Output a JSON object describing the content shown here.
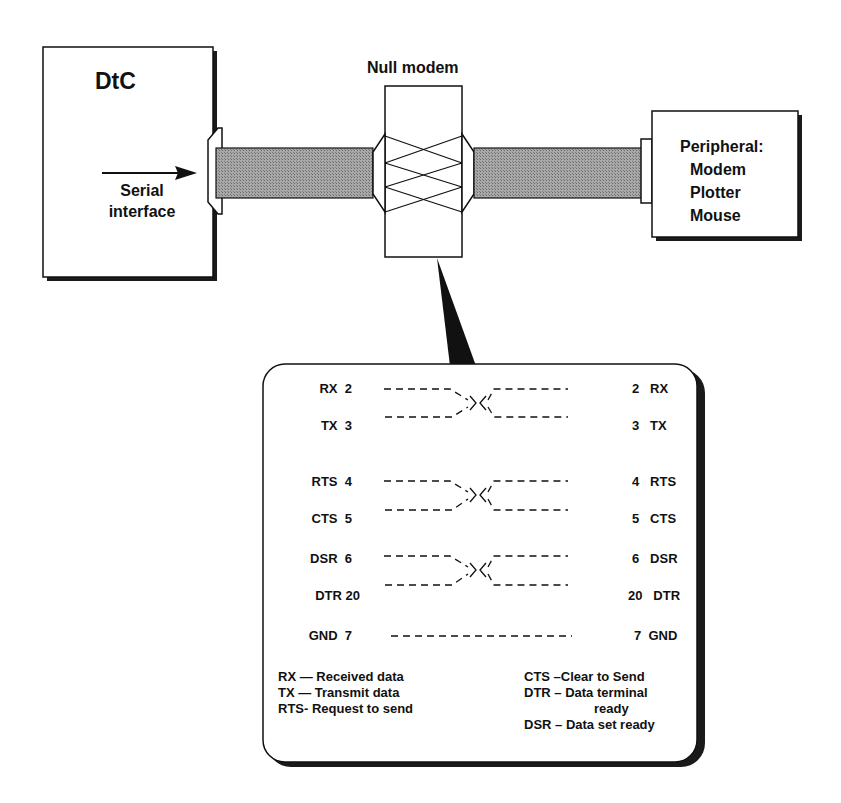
{
  "diagram": {
    "dtc": {
      "title": "DtC",
      "serial_label_line1": "Serial",
      "serial_label_line2": "interface"
    },
    "null_modem": {
      "label": "Null modem"
    },
    "peripheral": {
      "title": "Peripheral:",
      "items": [
        "Modem",
        "Plotter",
        "Mouse"
      ]
    },
    "pinout": {
      "rows": [
        {
          "left_name": "RX",
          "left_pin": "2",
          "right_pin": "2",
          "right_name": "RX"
        },
        {
          "left_name": "TX",
          "left_pin": "3",
          "right_pin": "3",
          "right_name": "TX"
        },
        {
          "left_name": "RTS",
          "left_pin": "4",
          "right_pin": "4",
          "right_name": "RTS"
        },
        {
          "left_name": "CTS",
          "left_pin": "5",
          "right_pin": "5",
          "right_name": "CTS"
        },
        {
          "left_name": "DSR",
          "left_pin": "6",
          "right_pin": "6",
          "right_name": "DSR"
        },
        {
          "left_name": "DTR",
          "left_pin": "20",
          "right_pin": "20",
          "right_name": "DTR"
        },
        {
          "left_name": "GND",
          "left_pin": "7",
          "right_pin": "7",
          "right_name": "GND"
        }
      ],
      "crossed_pairs": [
        [
          "RX",
          "TX"
        ],
        [
          "RTS",
          "CTS"
        ],
        [
          "DSR",
          "DTR"
        ]
      ],
      "straight": [
        "GND"
      ]
    },
    "legend_left": [
      "RX — Received data",
      "TX — Transmit data",
      "RTS- Request to send"
    ],
    "legend_right": [
      "CTS –Clear to Send",
      "DTR – Data terminal",
      "ready",
      "DSR – Data set ready"
    ],
    "colors": {
      "line": "#111111",
      "cable_fill": "#9a9a9a",
      "shadow": "#1a1a1a",
      "background": "#ffffff"
    }
  }
}
